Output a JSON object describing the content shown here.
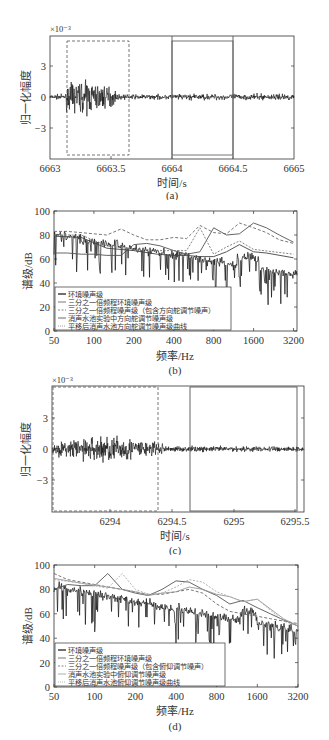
{
  "chart_data": [
    {
      "id": "a",
      "type": "line",
      "caption": "(a)",
      "xlabel": "时间/s",
      "ylabel": "归一化幅度",
      "y_multiplier": "×10⁻³",
      "xlim": [
        6663,
        6665
      ],
      "ylim": [
        -6,
        6
      ],
      "xticks": [
        "6663",
        "6663.5",
        "6664",
        "6664.5",
        "6665"
      ],
      "yticks": [
        "3",
        "0",
        "-3"
      ],
      "grid": false,
      "annotations": [
        {
          "shape": "dashed-rect",
          "x": [
            6663.13,
            6663.64
          ],
          "y": [
            -5.4,
            5.4
          ],
          "meaning": "noise burst segment"
        },
        {
          "shape": "solid-rect",
          "x": [
            6664.0,
            6664.5
          ],
          "y": [
            -5.4,
            5.4
          ],
          "meaning": "ambient segment"
        }
      ],
      "series": [
        {
          "name": "waveform",
          "description": "noise ±0.5e-3 baseline, burst up to ±4e-3 between 6663.15 and 6663.6 s"
        }
      ]
    },
    {
      "id": "b",
      "type": "line",
      "caption": "(b)",
      "xlabel": "频率/Hz",
      "ylabel": "谱级/dB",
      "xscale": "log2",
      "xlim": [
        50,
        3400
      ],
      "ylim": [
        0,
        100
      ],
      "xticks": [
        "50",
        "100",
        "200",
        "400",
        "800",
        "1600",
        "3200"
      ],
      "yticks": [
        "0",
        "20",
        "40",
        "60",
        "80",
        "100"
      ],
      "legend_position": "lower left",
      "legend": [
        "环境噪声级",
        "三分之一倍频程环境噪声级",
        "三分之一倍频程噪声级（包含方向舵调节噪声）",
        "消声水池实验中方向舵调节噪声级",
        "平移后消声水池方向舵调节噪声级曲线"
      ],
      "series": [
        {
          "name": "三分之一倍频程环境噪声级",
          "x": [
            50,
            63,
            80,
            100,
            125,
            160,
            200,
            250,
            315,
            400,
            500,
            630,
            800,
            1000,
            1250,
            1600,
            2000,
            2500,
            3200
          ],
          "values": [
            65,
            65,
            64,
            64,
            63,
            63,
            72,
            73,
            71,
            67,
            64,
            66,
            86,
            80,
            81,
            90,
            86,
            80,
            74
          ]
        },
        {
          "name": "三分之一倍频程噪声级（包含方向舵调节噪声）",
          "x": [
            50,
            63,
            80,
            100,
            125,
            160,
            200,
            250,
            315,
            400,
            500,
            630,
            800,
            1000,
            1250,
            1600,
            2000,
            2500,
            3200
          ],
          "values": [
            83,
            83,
            82,
            81,
            80,
            85,
            80,
            76,
            76,
            78,
            77,
            88,
            82,
            81,
            90,
            86,
            82,
            76,
            73
          ]
        },
        {
          "name": "消声水池实验中方向舵调节噪声级",
          "x": [
            50,
            80,
            125,
            200,
            300,
            400,
            500,
            630,
            800,
            1000,
            1250,
            1600,
            2000,
            3200
          ],
          "values": [
            79,
            78,
            69,
            67,
            64,
            63,
            63,
            62,
            62,
            66,
            72,
            66,
            65,
            61
          ]
        },
        {
          "name": "平移后消声水池方向舵调节噪声级曲线",
          "x": [
            50,
            80,
            125,
            200,
            300,
            500,
            630,
            800,
            1000,
            1250,
            1600,
            3200
          ],
          "values": [
            80,
            80,
            71,
            68,
            67,
            67,
            86,
            64,
            70,
            75,
            68,
            64
          ]
        },
        {
          "name": "环境噪声级",
          "description": "narrowband spectrum decreasing from ~82 dB at 50 Hz to ~45 dB at 3200 Hz with dips to ~20 dB"
        }
      ]
    },
    {
      "id": "c",
      "type": "line",
      "caption": "(c)",
      "xlabel": "时间/s",
      "ylabel": "归一化幅度",
      "y_multiplier": "×10⁻³",
      "xlim": [
        6293.65,
        6295.6
      ],
      "ylim": [
        -6,
        6
      ],
      "xticks": [
        "6294",
        "6294.5",
        "6295",
        "6295.5"
      ],
      "yticks": [
        "3",
        "0",
        "-3"
      ],
      "grid": false,
      "annotations": [
        {
          "shape": "dashed-rect",
          "x": [
            6293.66,
            6294.45
          ],
          "y": [
            -5.9,
            5.9
          ],
          "meaning": "noise burst segment"
        },
        {
          "shape": "solid-rect",
          "x": [
            6294.7,
            6295.57
          ],
          "y": [
            -5.9,
            5.9
          ],
          "meaning": "ambient segment"
        }
      ],
      "series": [
        {
          "name": "waveform",
          "description": "burst up to ±3e-3 between 6293.65 and 6294.35 s, then ±0.7e-3 baseline"
        }
      ]
    },
    {
      "id": "d",
      "type": "line",
      "caption": "(d)",
      "xlabel": "频率/Hz",
      "ylabel": "谱级/dB",
      "xscale": "log2",
      "xlim": [
        50,
        3200
      ],
      "ylim": [
        0,
        100
      ],
      "xticks": [
        "50",
        "100",
        "200",
        "400",
        "800",
        "1600",
        "3200"
      ],
      "yticks": [
        "0",
        "20",
        "40",
        "60",
        "80",
        "100"
      ],
      "legend_position": "lower left",
      "legend": [
        "环境噪声级",
        "三分之一倍频程环境噪声级",
        "三分之一倍频程噪声级（包含俯仰调节噪声）",
        "消声水池实验中俯仰调节噪声级",
        "平移后消声水池俯仰调节噪声级曲线"
      ],
      "series": [
        {
          "name": "三分之一倍频程环境噪声级",
          "x": [
            50,
            63,
            80,
            100,
            125,
            160,
            200,
            250,
            315,
            400,
            500,
            630,
            800,
            1000,
            1250,
            1600,
            2000,
            2500,
            3200
          ],
          "values": [
            80,
            84,
            83,
            83,
            93,
            80,
            77,
            75,
            80,
            87,
            86,
            80,
            75,
            68,
            71,
            65,
            60,
            55,
            50
          ]
        },
        {
          "name": "三分之一倍频程噪声级（包含俯仰调节噪声）",
          "x": [
            50,
            63,
            80,
            100,
            125,
            160,
            200,
            250,
            315,
            400,
            500,
            630,
            800,
            1000,
            1250,
            1600,
            2000,
            2500,
            3200
          ],
          "values": [
            93,
            88,
            86,
            84,
            82,
            80,
            78,
            76,
            76,
            78,
            80,
            77,
            68,
            62,
            60,
            58,
            56,
            54,
            52
          ]
        },
        {
          "name": "消声水池实验中俯仰调节噪声级",
          "x": [
            50,
            80,
            125,
            200,
            250,
            315,
            400,
            500,
            630,
            800,
            1000,
            1250,
            1600,
            2500,
            3200
          ],
          "values": [
            89,
            85,
            82,
            78,
            75,
            77,
            78,
            82,
            80,
            76,
            74,
            70,
            72,
            56,
            50
          ]
        },
        {
          "name": "平移后消声水池俯仰调节噪声级曲线",
          "x": [
            50,
            80,
            125,
            160,
            200,
            250,
            315,
            400,
            500,
            630,
            800,
            1000,
            1250,
            1600,
            2500,
            3200
          ],
          "values": [
            88,
            85,
            81,
            93,
            80,
            76,
            77,
            82,
            88,
            86,
            78,
            74,
            70,
            72,
            54,
            50
          ]
        },
        {
          "name": "环境噪声级",
          "description": "narrowband spectrum decreasing from ~82 dB at 50 Hz to ~40 dB at 3200 Hz with dips to ~20 dB"
        }
      ]
    }
  ],
  "panels": {
    "a": {
      "caption": "(a)",
      "xlabel": "时间/s",
      "ylabel": "归一化幅度",
      "exp": "×10⁻³",
      "xticks": [
        "6663",
        "6663.5",
        "6664",
        "6664.5",
        "6665"
      ],
      "yticks": [
        "3",
        "0",
        "−3"
      ]
    },
    "b": {
      "caption": "(b)",
      "xlabel": "频率/Hz",
      "ylabel": "谱级/dB",
      "xticks": [
        "50",
        "100",
        "200",
        "400",
        "800",
        "1600",
        "3200"
      ],
      "yticks": [
        "100",
        "80",
        "60",
        "40",
        "20",
        "0"
      ],
      "legend": [
        "环境噪声级",
        "三分之一倍频程环境噪声级",
        "三分之一倍频程噪声级（包含方向舵调节噪声）",
        "消声水池实验中方向舵调节噪声级",
        "平移后消声水池方向舵调节噪声级曲线"
      ]
    },
    "c": {
      "caption": "(c)",
      "xlabel": "时间/s",
      "ylabel": "归一化幅度",
      "exp": "×10⁻³",
      "xticks": [
        "6294",
        "6294.5",
        "6295",
        "6295.5"
      ],
      "yticks": [
        "3",
        "0",
        "−3"
      ]
    },
    "d": {
      "caption": "(d)",
      "xlabel": "频率/Hz",
      "ylabel": "谱级/dB",
      "xticks": [
        "50",
        "100",
        "200",
        "400",
        "800",
        "1600",
        "3200"
      ],
      "yticks": [
        "100",
        "80",
        "60",
        "40",
        "20",
        "0"
      ],
      "legend": [
        "环境噪声级",
        "三分之一倍频程环境噪声级",
        "三分之一倍频程噪声级（包含俯仰调节噪声）",
        "消声水池实验中俯仰调节噪声级",
        "平移后消声水池俯仰调节噪声级曲线"
      ]
    }
  },
  "colors": {
    "axis": "#333333",
    "signal": "#111111",
    "gray_line": "#777777",
    "dashed": "#666666",
    "light": "#999999"
  }
}
